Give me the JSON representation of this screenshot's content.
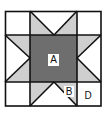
{
  "diagram": {
    "type": "quilt-block-star",
    "labels": {
      "center_square": "A",
      "star_point_triangle": "B",
      "corner_region": "D"
    },
    "colors": {
      "outline": "#111111",
      "center_fill": "#6e6e6e",
      "star_point_fill": "#cfcfcf",
      "background_fill": "#ffffff"
    }
  }
}
